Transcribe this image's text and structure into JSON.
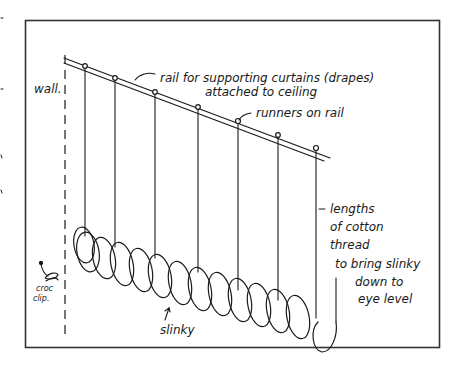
{
  "diagram": {
    "labels": {
      "wall": "wall.",
      "rail_line1": "rail for supporting curtains (drapes)",
      "rail_line2": "attached to ceiling",
      "runners": "runners on rail",
      "thread_line1": "lengths",
      "thread_line2": "of cotton",
      "thread_line3": "thread",
      "thread_line4": "to bring slinky",
      "thread_line5": "down to",
      "thread_line6": "eye level",
      "croc_line1": "croc",
      "croc_line2": "clip.",
      "slinky": "slinky"
    },
    "runner_count": 7,
    "thread_count": 7,
    "colors": {
      "ink": "#1a1a1a",
      "background": "#ffffff",
      "frame": "#333333"
    }
  }
}
